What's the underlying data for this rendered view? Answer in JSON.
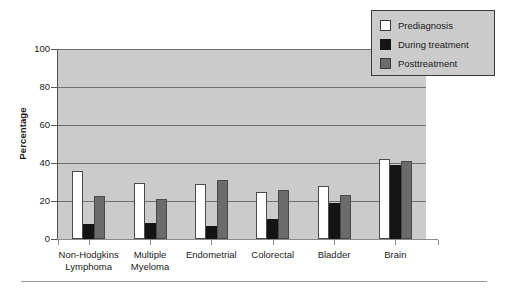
{
  "chart_data": {
    "type": "bar",
    "title": "",
    "xlabel": "",
    "ylabel": "Percentage",
    "ylim": [
      0,
      100
    ],
    "yticks": [
      0,
      20,
      40,
      60,
      80,
      100
    ],
    "ytick_labels": [
      "0",
      "20",
      "40",
      "60",
      "80",
      "100"
    ],
    "grid": true,
    "legend_position": "top-right",
    "categories": [
      "Non-Hodgkins Lymphoma",
      "Multiple Myeloma",
      "Endometrial",
      "Colorectal",
      "Bladder",
      "Brain"
    ],
    "category_lines": [
      [
        "Non-Hodgkins",
        "Lymphoma"
      ],
      [
        "Multiple",
        "Myeloma"
      ],
      [
        "Endometrial"
      ],
      [
        "Colorectal"
      ],
      [
        "Bladder"
      ],
      [
        "Brain"
      ]
    ],
    "series": [
      {
        "name": "Prediagnosis",
        "color": "#ffffff",
        "values": [
          36,
          29.5,
          29,
          25,
          28,
          42
        ]
      },
      {
        "name": "During treatment",
        "color": "#141414",
        "values": [
          8,
          8.5,
          7,
          10.5,
          19,
          39
        ]
      },
      {
        "name": "Posttreatment",
        "color": "#6b6b6b",
        "values": [
          22.5,
          21,
          31,
          26,
          23,
          41
        ]
      }
    ]
  },
  "legend": {
    "items": [
      {
        "label": "Prediagnosis",
        "swatch": "prediagnosis"
      },
      {
        "label": "During treatment",
        "swatch": "during"
      },
      {
        "label": "Posttreatment",
        "swatch": "post"
      }
    ]
  },
  "axis": {
    "y_title": "Percentage"
  }
}
